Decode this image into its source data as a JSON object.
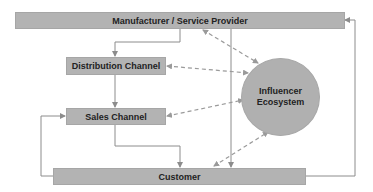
{
  "diagram": {
    "nodes": {
      "manufacturer": {
        "label": "Manufacturer / Service Provider"
      },
      "distribution": {
        "label": "Distribution Channel"
      },
      "sales": {
        "label": "Sales Channel"
      },
      "customer": {
        "label": "Customer"
      },
      "influencer": {
        "line1": "Influencer",
        "line2": "Ecosystem"
      }
    },
    "colors": {
      "box_fill": "#b3b3b3",
      "line": "#8c8c8c",
      "dashed": "#9a9a9a"
    },
    "edges": [
      {
        "from": "manufacturer",
        "to": "distribution",
        "style": "solid"
      },
      {
        "from": "distribution",
        "to": "sales",
        "style": "solid"
      },
      {
        "from": "sales",
        "to": "customer",
        "style": "solid"
      },
      {
        "from": "manufacturer",
        "to": "customer",
        "style": "solid"
      },
      {
        "from": "customer",
        "to": "manufacturer",
        "style": "solid"
      },
      {
        "from": "customer",
        "to": "sales",
        "style": "solid"
      },
      {
        "from": "influencer",
        "to": "manufacturer",
        "style": "dashed",
        "bidirectional": true
      },
      {
        "from": "influencer",
        "to": "distribution",
        "style": "dashed",
        "bidirectional": true
      },
      {
        "from": "influencer",
        "to": "sales",
        "style": "dashed",
        "bidirectional": true
      },
      {
        "from": "influencer",
        "to": "customer",
        "style": "dashed",
        "bidirectional": true
      }
    ]
  }
}
